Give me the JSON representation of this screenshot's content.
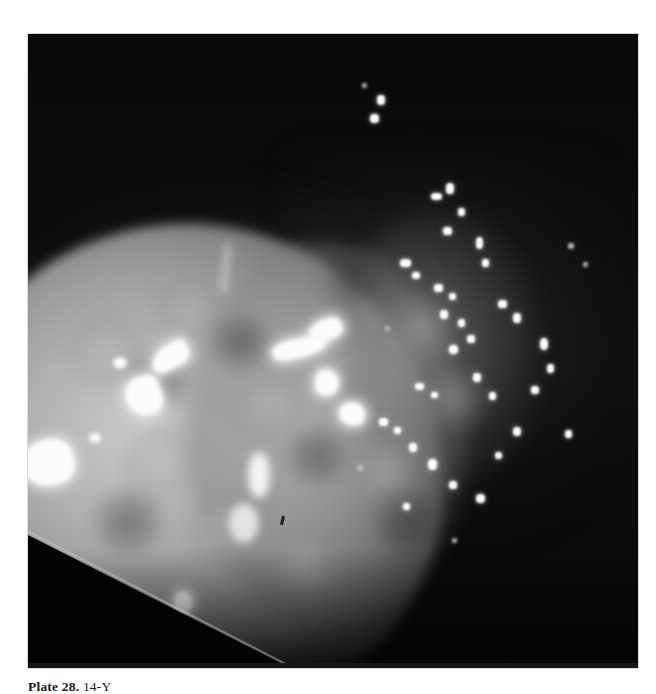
{
  "page": {
    "background_color": "#ffffff",
    "width": 656,
    "height": 694
  },
  "plate": {
    "name": "medical-imaging-plate",
    "kind": "grayscale-radiographic-photograph",
    "frame": {
      "x": 28,
      "y": 34,
      "width": 610,
      "height": 634
    },
    "background_color": "#070707",
    "highlight_color": "#ffffff",
    "midtone_color": "#9a9a9a",
    "description": "Dark field with a large luminous rounded mass at lower left and a diagonal cluster of small bright specks toward the upper right",
    "regions": [
      {
        "label": "dark-field",
        "tone": "black"
      },
      {
        "label": "luminous-mass",
        "tone": "light-gray"
      },
      {
        "label": "speckle-cluster",
        "tone": "white-points"
      },
      {
        "label": "corner-wedge",
        "tone": "black"
      }
    ]
  },
  "caption": {
    "lead": "Plate 28.",
    "rest": "14-Y",
    "clipped": true
  }
}
